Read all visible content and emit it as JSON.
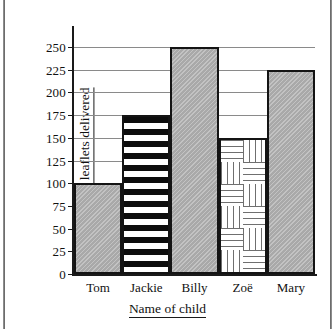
{
  "chart_data": {
    "type": "bar",
    "title": "",
    "xlabel": "Name of child",
    "ylabel": "Number of leaflets delivered",
    "categories": [
      "Tom",
      "Jackie",
      "Billy",
      "Zoë",
      "Mary"
    ],
    "values": [
      100,
      175,
      250,
      150,
      225
    ],
    "ylim": [
      0,
      260
    ],
    "yticks": [
      0,
      25,
      50,
      75,
      100,
      125,
      150,
      175,
      200,
      225,
      250
    ],
    "ytick_labels": [
      "0",
      "25",
      "50",
      "75",
      "100",
      "125",
      "150",
      "175",
      "200",
      "225",
      "250"
    ],
    "gridlines_at": [
      100,
      125,
      150,
      175,
      200,
      225,
      250
    ],
    "grid": true,
    "legend": "none",
    "bar_gap": 0,
    "series": [
      {
        "name": "Leaflets delivered",
        "values": [
          100,
          175,
          250,
          150,
          225
        ],
        "fills": [
          "gray-solid",
          "horizontal-stripes",
          "gray-solid",
          "basket-weave",
          "gray-solid"
        ]
      }
    ],
    "colors": {
      "gray_fill": "#b2b2b2",
      "stripe_dark": "#0d0d0d",
      "stripe_light": "#ffffff",
      "weave_line": "#6f6f6f",
      "bar_outline": "#141414",
      "gridline": "#8a8a8a",
      "axis": "#1a1a1a",
      "background": "#ffffff",
      "text": "#111111"
    }
  },
  "axes": {
    "y_title": "Number of leaflets delivered",
    "x_title": "Name of child"
  }
}
